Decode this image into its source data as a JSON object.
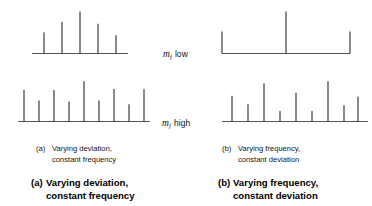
{
  "figure": {
    "stroke_color": "#333333",
    "baseline_color": "#555555"
  },
  "labels": {
    "mf_low": {
      "variable": "m",
      "subscript": "f",
      "qualifier": "low"
    },
    "mf_high": {
      "variable": "m",
      "subscript": "f",
      "qualifier": "high"
    }
  },
  "inner_captions": {
    "a": {
      "tag": "(a)",
      "line1": "Varying deviation,",
      "line2": "constant frequency"
    },
    "b": {
      "tag": "(b)",
      "line1": "Varying frequency,",
      "line2": "constant deviation"
    }
  },
  "outer_captions": {
    "a": {
      "tag": "(a)",
      "line1": "Varying deviation,",
      "line2": "constant frequency"
    },
    "b": {
      "tag": "(b)",
      "line1": "Varying frequency,",
      "line2": "constant deviation"
    }
  },
  "chart_data": [
    {
      "id": "top-left",
      "type": "bar",
      "title": "Varying deviation, constant frequency - mf low",
      "xlabel": "",
      "ylabel": "",
      "grid": false,
      "legend": null,
      "baseline": true,
      "xlim": [
        0,
        140
      ],
      "ylim": [
        0,
        46
      ],
      "axis_extends_left": 12,
      "axis_extends_right": 12,
      "x": [
        30,
        48,
        66,
        84,
        102
      ],
      "values": [
        22,
        33,
        44,
        31,
        19
      ],
      "categories": [
        "-2fm",
        "-fm",
        "fc",
        "+fm",
        "+2fm"
      ]
    },
    {
      "id": "bottom-left",
      "type": "bar",
      "title": "Varying deviation, constant frequency - mf high",
      "xlabel": "",
      "ylabel": "",
      "grid": false,
      "legend": null,
      "baseline": true,
      "xlim": [
        0,
        140
      ],
      "ylim": [
        0,
        46
      ],
      "axis_extends_left": 6,
      "axis_extends_right": 6,
      "x": [
        10,
        25,
        40,
        55,
        70,
        85,
        100,
        115,
        130
      ],
      "values": [
        33,
        22,
        33,
        21,
        42,
        22,
        34,
        18,
        34
      ],
      "categories": [
        "-4fm",
        "-3fm",
        "-2fm",
        "-fm",
        "fc",
        "+fm",
        "+2fm",
        "+3fm",
        "+4fm"
      ]
    },
    {
      "id": "top-right",
      "type": "bar",
      "title": "Varying frequency, constant deviation - mf low",
      "xlabel": "",
      "ylabel": "",
      "grid": false,
      "legend": null,
      "baseline": true,
      "xlim": [
        0,
        142
      ],
      "ylim": [
        0,
        46
      ],
      "axis_extends_left": 0,
      "axis_extends_right": 0,
      "x": [
        4,
        68,
        132
      ],
      "values": [
        23,
        44,
        23
      ],
      "categories": [
        "-fm",
        "fc",
        "+fm"
      ]
    },
    {
      "id": "bottom-right",
      "type": "bar",
      "title": "Varying frequency, constant deviation - mf high",
      "xlabel": "",
      "ylabel": "",
      "grid": false,
      "legend": null,
      "baseline": true,
      "xlim": [
        0,
        142
      ],
      "ylim": [
        0,
        46
      ],
      "axis_extends_left": 10,
      "axis_extends_right": 10,
      "x": [
        14,
        30,
        46,
        62,
        78,
        94,
        110,
        126
      ],
      "values": [
        27,
        18,
        40,
        11,
        30,
        11,
        42,
        17
      ],
      "categories": [
        "-4fm",
        "-3fm",
        "-2fm",
        "-fm",
        "fc",
        "+fm",
        "+2fm",
        "+3fm"
      ],
      "extra_point": {
        "x": 140,
        "value": 26,
        "category": "+4fm"
      }
    }
  ]
}
